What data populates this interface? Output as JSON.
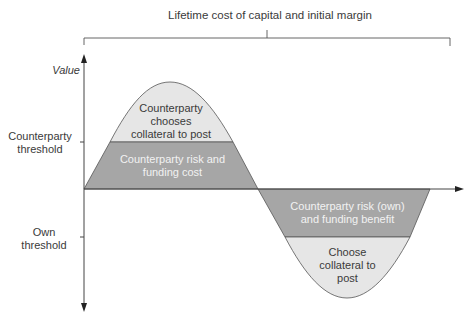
{
  "title": "Lifetime cost of capital and initial margin",
  "axis": {
    "y_label": "Value",
    "ticks": [
      {
        "label_line1": "Counterparty",
        "label_line2": "threshold"
      },
      {
        "label_line1": "Own",
        "label_line2": "threshold"
      }
    ]
  },
  "regions": {
    "upper_light": {
      "line1": "Counterparty",
      "line2": "chooses",
      "line3": "collateral to post"
    },
    "upper_dark": {
      "line1": "Counterparty risk and",
      "line2": "funding cost"
    },
    "lower_dark": {
      "line1": "Counterparty risk (own)",
      "line2": "and funding benefit"
    },
    "lower_light": {
      "line1": "Choose",
      "line2": "collateral to",
      "line3": "post"
    }
  },
  "colors": {
    "light_fill": "#e6e6e6",
    "dark_fill": "#a6a6a6",
    "line": "#444444"
  }
}
